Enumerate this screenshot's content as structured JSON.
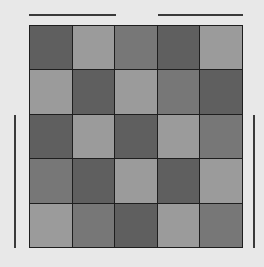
{
  "puzzle": {
    "rows": 5,
    "cols": 5,
    "shade_legend": {
      "D": "#5f5f5f",
      "M": "#777777",
      "L": "#9b9b9b"
    },
    "cells": [
      [
        "D",
        "L",
        "M",
        "D",
        "L"
      ],
      [
        "L",
        "D",
        "L",
        "M",
        "D"
      ],
      [
        "D",
        "L",
        "D",
        "L",
        "M"
      ],
      [
        "M",
        "D",
        "L",
        "D",
        "L"
      ],
      [
        "L",
        "M",
        "D",
        "L",
        "M"
      ]
    ],
    "grid_line_color": "#1e1e1e",
    "background": "#e8e8e8"
  },
  "clue_bars": {
    "top_left": {
      "x": 29,
      "y": 14,
      "w": 87,
      "h": 2
    },
    "top_right": {
      "x": 158,
      "y": 14,
      "w": 85,
      "h": 2
    },
    "left": {
      "x": 14,
      "y": 115,
      "w": 2,
      "h": 133
    },
    "right": {
      "x": 253,
      "y": 115,
      "w": 2,
      "h": 133
    }
  }
}
